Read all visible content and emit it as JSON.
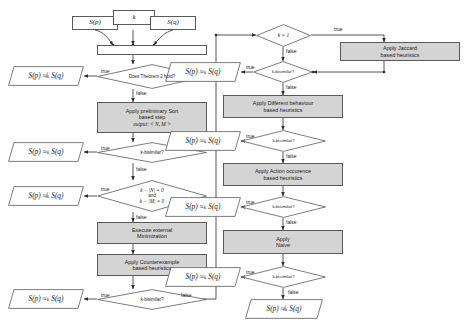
{
  "diagram": {
    "colors": {
      "process_fill": "#d4d4d4",
      "stroke": "#5a5a5a",
      "page": "#ffffff"
    },
    "inputs": [
      {
        "name": "input-sp",
        "label": "S(p)"
      },
      {
        "name": "input-k",
        "label": "k"
      },
      {
        "name": "input-sq",
        "label": "S(q)"
      }
    ],
    "decisions": [
      {
        "id": "d1",
        "label": "Does Theorem 2 hold?"
      },
      {
        "id": "d2",
        "label": "k-bisimilar?"
      },
      {
        "id": "d3",
        "label": "k − |N| = 0\nand\nk − |M| = 0",
        "lines": [
          "k − |N| = 0",
          "and",
          "k − |M| = 0"
        ]
      },
      {
        "id": "d4",
        "label": "k-bisimilar?"
      },
      {
        "id": "d5",
        "label": "k = 1"
      },
      {
        "id": "d6",
        "label": "k-bisimilar?"
      },
      {
        "id": "d7",
        "label": "k-bisimilar?"
      },
      {
        "id": "d8",
        "label": "k-bisimilar?"
      },
      {
        "id": "d9",
        "label": "k-bisimilar?"
      }
    ],
    "processes": [
      {
        "id": "p1",
        "lines": [
          "Apply preliminary Sort",
          "based step",
          "output: < N, M >"
        ]
      },
      {
        "id": "p2",
        "lines": [
          "Execute external",
          "Minimization"
        ]
      },
      {
        "id": "p3",
        "lines": [
          "Apply Counterexample",
          "based heuristics"
        ]
      },
      {
        "id": "p4",
        "lines": [
          "Apply Jaccard",
          "based heuristics"
        ]
      },
      {
        "id": "p5",
        "lines": [
          "Apply Different behaviour",
          "based heuristics"
        ]
      },
      {
        "id": "p6",
        "lines": [
          "Apply Action occurence",
          "based heuristics"
        ]
      },
      {
        "id": "p7",
        "lines": [
          "Apply",
          "Naive"
        ]
      }
    ],
    "terminals": [
      {
        "id": "t1",
        "label": "S(p) ≉ₖ S(q)",
        "relation": "not-k-bisimilar"
      },
      {
        "id": "t2",
        "label": "S(p) ≈ₖ S(q)",
        "relation": "k-bisimilar"
      },
      {
        "id": "t3",
        "label": "S(p) ≉ₖ S(q)",
        "relation": "not-k-bisimilar"
      },
      {
        "id": "t4",
        "label": "S(p) ≈ₖ S(q)",
        "relation": "k-bisimilar"
      },
      {
        "id": "t5",
        "label": "S(p) ≈ₖ S(q)",
        "relation": "k-bisimilar"
      },
      {
        "id": "t6",
        "label": "S(p) ≈ₖ S(q)",
        "relation": "k-bisimilar"
      },
      {
        "id": "t7",
        "label": "S(p) ≈ₖ S(q)",
        "relation": "k-bisimilar"
      },
      {
        "id": "t8",
        "label": "S(p) ≈ₖ S(q)",
        "relation": "k-bisimilar"
      },
      {
        "id": "t9",
        "label": "S(p) ≉ₖ S(q)",
        "relation": "not-k-bisimilar"
      }
    ],
    "edge_labels": {
      "true": "true",
      "false": "false"
    }
  }
}
